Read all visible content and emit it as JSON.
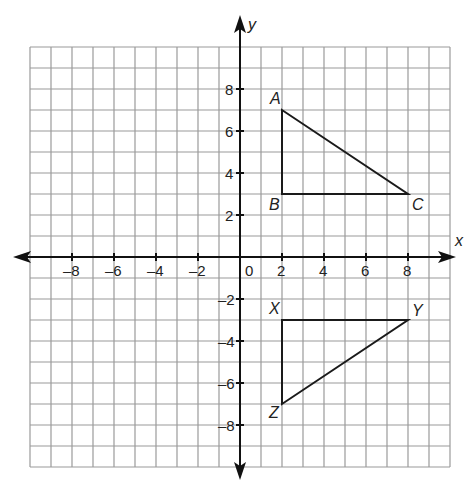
{
  "diagram": {
    "type": "coordinate-plane",
    "x_axis": {
      "name": "x",
      "min": -10,
      "max": 10,
      "tick_labels": [
        "-8",
        "-6",
        "-4",
        "-2",
        "0",
        "2",
        "4",
        "6",
        "8"
      ]
    },
    "y_axis": {
      "name": "y",
      "min": -10,
      "max": 10,
      "tick_labels": [
        "8",
        "6",
        "4",
        "2",
        "-2",
        "-4",
        "-6",
        "-8"
      ]
    },
    "origin_label": "0",
    "colors": {
      "grid": "#9a9a9a",
      "axis": "#111111",
      "shape": "#1a1a1a",
      "text": "#222222"
    },
    "triangles": [
      {
        "name": "ABC",
        "vertices": [
          {
            "label": "A",
            "x": 2,
            "y": 7
          },
          {
            "label": "B",
            "x": 2,
            "y": 3
          },
          {
            "label": "C",
            "x": 8,
            "y": 3
          }
        ]
      },
      {
        "name": "XYZ",
        "vertices": [
          {
            "label": "X",
            "x": 2,
            "y": -3
          },
          {
            "label": "Y",
            "x": 8,
            "y": -3
          },
          {
            "label": "Z",
            "x": 2,
            "y": -7
          }
        ]
      }
    ]
  }
}
